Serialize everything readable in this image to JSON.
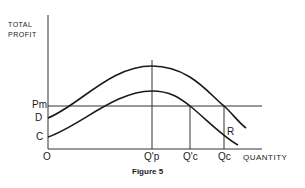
{
  "figure": {
    "caption": "Figure 5",
    "y_axis_title_line1": "TOTAL",
    "y_axis_title_line2": "PROFIT",
    "x_axis_title": "QUANTITY",
    "origin_label": "O",
    "y_labels": {
      "pm": "Pm",
      "d": "D",
      "c": "C"
    },
    "x_labels": {
      "qp": "Q'p",
      "qc_prime": "Q'c",
      "qc": "Qc"
    },
    "curve_label": "R",
    "line_color": "#1a1a1a"
  }
}
